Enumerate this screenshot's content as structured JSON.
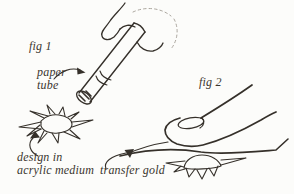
{
  "figures": {
    "fig1": {
      "label": "fig 1",
      "annotations": {
        "paper_line1": "paper",
        "paper_line2": "tube",
        "design_line1": "design in",
        "design_line2": "acrylic medium"
      },
      "drawings": {
        "hand": "hand-holding-paper-tube-sketch",
        "tube": "rolled-paper-tube",
        "star": "sunburst-design-in-acrylic-medium"
      }
    },
    "fig2": {
      "label": "fig 2",
      "annotations": {
        "transfer_gold": "transfer gold"
      },
      "drawings": {
        "finger": "finger-pressing-down",
        "sheet": "transfer-gold-leaf-sheet",
        "star": "sunburst-design-under-sheet"
      }
    }
  },
  "colors": {
    "ink": "#35302a",
    "ink_light": "#aba69e",
    "text": "#3a352e",
    "paper": "#fcfcfa"
  }
}
